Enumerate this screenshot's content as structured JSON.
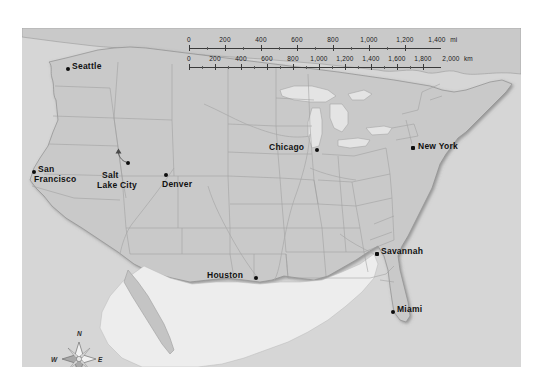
{
  "figure": {
    "kind": "reference-map",
    "region": "contiguous-united-states",
    "land_color": "#c9c9c9",
    "water_color": "#e9e9e9",
    "background_color": "#d6d6d6",
    "page_color": "#ffffff",
    "border_color": "#8a8a8a",
    "label_color": "#111111"
  },
  "scale_bar": {
    "miles": {
      "unit_label": "mi",
      "ticks": [
        "0",
        "200",
        "400",
        "600",
        "800",
        "1,000",
        "1,200",
        "1,400"
      ],
      "values": [
        0,
        200,
        400,
        600,
        800,
        1000,
        1200,
        1400
      ]
    },
    "kilometers": {
      "unit_label": "km",
      "ticks": [
        "0",
        "200",
        "400",
        "600",
        "800",
        "1,000",
        "1,200",
        "1,400",
        "1,600",
        "1,800",
        "2,000"
      ],
      "values": [
        0,
        200,
        400,
        600,
        800,
        1000,
        1200,
        1400,
        1600,
        1800,
        2000
      ]
    }
  },
  "compass": {
    "north": "N",
    "south": "S",
    "east": "E",
    "west": "W"
  },
  "cities": [
    {
      "name": "Seattle",
      "label": "Seattle",
      "dot_x": 44,
      "dot_y": 39,
      "label_x": 49,
      "label_y": 35,
      "align": "left",
      "lines": [
        "Seattle"
      ]
    },
    {
      "name": "San Francisco",
      "label": "San Francisco",
      "dot_x": 10,
      "dot_y": 142,
      "label_x": 15,
      "label_y": 138,
      "align": "left",
      "lines": [
        "San",
        "Francisco"
      ]
    },
    {
      "name": "Salt Lake City",
      "label": "Salt Lake City",
      "dot_x": 105,
      "dot_y": 134,
      "label_x": 81,
      "label_y": 122,
      "align": "left",
      "lines": [
        "Salt",
        "Lake City"
      ]
    },
    {
      "name": "Denver",
      "label": "Denver",
      "dot_x": 142,
      "dot_y": 146,
      "label_x": 141,
      "label_y": 151,
      "align": "left",
      "lines": [
        "Denver"
      ]
    },
    {
      "name": "Chicago",
      "label": "Chicago",
      "dot_x": 293,
      "dot_y": 122,
      "label_x": 290,
      "label_y": 115,
      "align": "right",
      "lines": [
        "Chicago"
      ]
    },
    {
      "name": "New York",
      "label": "New York",
      "dot_x": 391,
      "dot_y": 119,
      "label_x": 397,
      "label_y": 115,
      "align": "left",
      "lines": [
        "New York"
      ]
    },
    {
      "name": "Savannah",
      "label": "Savannah",
      "dot_x": 353,
      "dot_y": 225,
      "label_x": 358,
      "label_y": 221,
      "align": "left",
      "lines": [
        "Savannah"
      ]
    },
    {
      "name": "Houston",
      "label": "Houston",
      "dot_x": 231,
      "dot_y": 249,
      "label_x": 228,
      "label_y": 244,
      "align": "right",
      "lines": [
        "Houston"
      ]
    },
    {
      "name": "Miami",
      "label": "Miami",
      "dot_x": 370,
      "dot_y": 283,
      "label_x": 375,
      "label_y": 279,
      "align": "left",
      "lines": [
        "Miami"
      ]
    }
  ]
}
